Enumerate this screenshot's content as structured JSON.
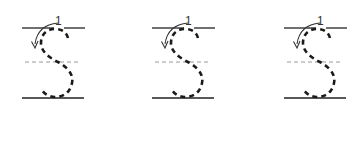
{
  "worksheet": {
    "letter": "S",
    "stroke_number": "1",
    "colors": {
      "stroke": "#1a1a1a",
      "guide_solid": "#222222",
      "guide_dashed": "#9a9a9a",
      "arrow": "#333333"
    },
    "glyphs": [
      {
        "id": 1,
        "x": 20,
        "stroke_number": "1"
      },
      {
        "id": 2,
        "x": 150,
        "stroke_number": "1"
      },
      {
        "id": 3,
        "x": 282,
        "stroke_number": "1"
      }
    ]
  }
}
